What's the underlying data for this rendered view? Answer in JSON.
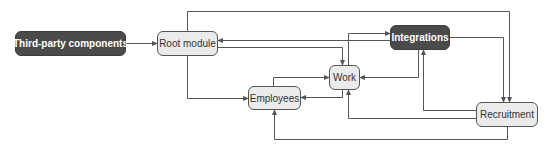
{
  "diagram": {
    "colors": {
      "dark_node_fill": "#4a4a4a",
      "light_node_fill": "#ebebeb",
      "edge": "#555555",
      "background": "#ffffff"
    },
    "nodes": [
      {
        "id": "third_party",
        "label": "Third-party components",
        "style": "dark"
      },
      {
        "id": "root",
        "label": "Root module",
        "style": "light"
      },
      {
        "id": "integrations",
        "label": "Integrations",
        "style": "dark"
      },
      {
        "id": "work",
        "label": "Work",
        "style": "light"
      },
      {
        "id": "employees",
        "label": "Employees",
        "style": "light"
      },
      {
        "id": "recruitment",
        "label": "Recruitment",
        "style": "light"
      }
    ],
    "edges": [
      {
        "from": "Third-party components",
        "to": "Root module"
      },
      {
        "from": "Root module",
        "to": "Recruitment"
      },
      {
        "from": "Root module",
        "to": "Employees"
      },
      {
        "from": "Root module",
        "to": "Work"
      },
      {
        "from": "Integrations",
        "to": "Root module"
      },
      {
        "from": "Work",
        "to": "Integrations"
      },
      {
        "from": "Integrations",
        "to": "Recruitment"
      },
      {
        "from": "Integrations",
        "to": "Work"
      },
      {
        "from": "Employees",
        "to": "Work"
      },
      {
        "from": "Work",
        "to": "Employees"
      },
      {
        "from": "Recruitment",
        "to": "Integrations"
      },
      {
        "from": "Recruitment",
        "to": "Work"
      },
      {
        "from": "Recruitment",
        "to": "Employees"
      }
    ]
  }
}
